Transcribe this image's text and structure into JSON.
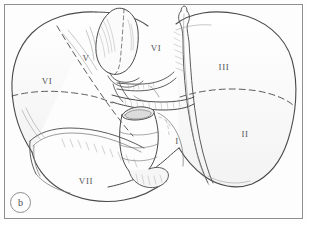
{
  "figure": {
    "panel_letter": "b",
    "caption_type": "anatomical-line-drawing",
    "view": "inferior visceral surface",
    "frame_color": "#8f8f8f",
    "ink_color": "#4a4a4a",
    "background_color": "#fdfdfd"
  },
  "segments": [
    {
      "id": "seg-vi-left",
      "label": "VI",
      "x": 47,
      "y": 81
    },
    {
      "id": "seg-v",
      "label": "V",
      "x": 86,
      "y": 58
    },
    {
      "id": "seg-vi-upper",
      "label": "VI",
      "x": 156,
      "y": 48
    },
    {
      "id": "seg-iii",
      "label": "III",
      "x": 224,
      "y": 67
    },
    {
      "id": "seg-ii",
      "label": "II",
      "x": 245,
      "y": 134
    },
    {
      "id": "seg-i",
      "label": "I",
      "x": 177,
      "y": 141
    },
    {
      "id": "seg-vii",
      "label": "VII",
      "x": 86,
      "y": 181
    }
  ],
  "structures": [
    {
      "name": "gallbladder",
      "region": "upper-center-left"
    },
    {
      "name": "inferior-vena-cava-stump",
      "region": "center"
    },
    {
      "name": "portal-vein",
      "region": "hilum"
    },
    {
      "name": "hepatic-artery",
      "region": "hilum"
    },
    {
      "name": "bile-duct",
      "region": "hilum"
    },
    {
      "name": "falciform-remnant",
      "region": "center-right"
    }
  ]
}
